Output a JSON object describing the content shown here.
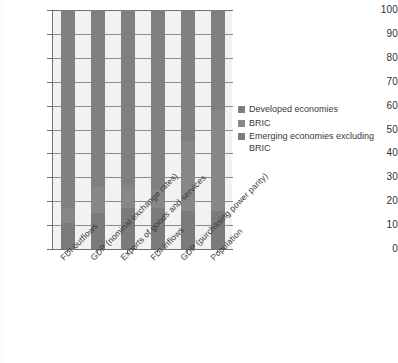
{
  "chart_data": {
    "type": "bar",
    "subtype": "stacked-100-percent",
    "title": "",
    "xlabel": "",
    "ylabel": "",
    "ylim": [
      0,
      100
    ],
    "ytick_values": [
      0,
      10,
      20,
      30,
      40,
      50,
      60,
      70,
      80,
      90,
      100
    ],
    "ytick_labels": [
      "0",
      "10",
      "20",
      "30",
      "40",
      "50",
      "60",
      "70",
      "80",
      "90",
      "100"
    ],
    "grid": true,
    "legend_position": "right",
    "categories": [
      "FDI outflows",
      "GDP (nominal exchange rates)",
      "Exports of goods and services",
      "FDI inflows",
      "GDP (purchasing power parity)",
      "Population"
    ],
    "series": [
      {
        "name": "Emerging economies excluding BRIC",
        "color": "#7b7b7b",
        "values": [
          11,
          15,
          17,
          17,
          16,
          16
        ]
      },
      {
        "name": "BRIC",
        "color": "#878787",
        "values": [
          6,
          11,
          9,
          8,
          29,
          42
        ]
      },
      {
        "name": "Developed economies",
        "color": "#808080",
        "values": [
          83,
          74,
          74,
          75,
          55,
          42
        ]
      }
    ]
  },
  "legend": {
    "items": [
      {
        "label": "Developed economies",
        "color": "#808080"
      },
      {
        "label": "BRIC",
        "color": "#878787"
      },
      {
        "label": "Emerging economies excluding BRIC",
        "color": "#7b7b7b"
      }
    ]
  }
}
